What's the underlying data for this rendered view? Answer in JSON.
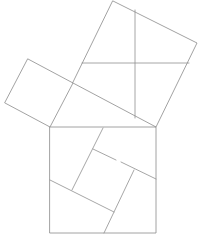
{
  "diagram": {
    "title": "",
    "stroke_color": "#8a8a8a",
    "background": "#ffffff",
    "shapes": {
      "hypotenuse_square": {
        "points": [
          [
            50,
            127
          ],
          [
            156,
            127
          ],
          [
            156,
            233
          ],
          [
            50,
            233
          ]
        ]
      },
      "leg_square_large": {
        "points": [
          [
            113,
            1
          ],
          [
            197,
            43
          ],
          [
            156,
            127
          ],
          [
            73,
            83
          ]
        ]
      },
      "leg_square_small": {
        "points": [
          [
            28,
            59
          ],
          [
            73,
            83
          ],
          [
            50,
            127
          ],
          [
            5,
            103
          ]
        ]
      }
    },
    "large_square_cuts": [
      {
        "from": [
          135,
          10
        ],
        "to": [
          135,
          118
        ]
      },
      {
        "from": [
          82,
          63
        ],
        "to": [
          189,
          63
        ]
      }
    ],
    "hypotenuse_square_cuts": [
      {
        "from": [
          103,
          128
        ],
        "to": [
          72,
          190
        ]
      },
      {
        "from": [
          93,
          149
        ],
        "to": [
          116,
          160
        ]
      },
      {
        "from": [
          121,
          162
        ],
        "to": [
          156,
          179
        ]
      },
      {
        "from": [
          50,
          180
        ],
        "to": [
          114,
          212
        ]
      },
      {
        "from": [
          134,
          170
        ],
        "to": [
          104,
          233
        ]
      }
    ]
  }
}
